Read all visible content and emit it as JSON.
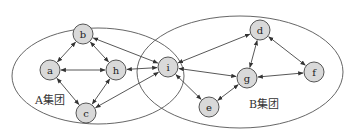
{
  "title": "",
  "colors": {
    "node_fill": "#d9d9d9",
    "node_stroke": "#555555",
    "edge": "#444444",
    "ellipse": "#555555",
    "text": "#333333"
  },
  "groups": [
    {
      "id": "A",
      "label": "A集团",
      "cx": 98,
      "cy": 76,
      "rx": 86,
      "ry": 48,
      "label_x": 35,
      "label_y": 104
    },
    {
      "id": "B",
      "label": "B集团",
      "cx": 240,
      "cy": 72,
      "rx": 103,
      "ry": 56,
      "label_x": 249,
      "label_y": 108
    }
  ],
  "nodes": [
    {
      "id": "a",
      "label": "a",
      "x": 50,
      "y": 70,
      "group": "A"
    },
    {
      "id": "b",
      "label": "b",
      "x": 83,
      "y": 34,
      "group": "A"
    },
    {
      "id": "h",
      "label": "h",
      "x": 116,
      "y": 70,
      "group": "A"
    },
    {
      "id": "c",
      "label": "c",
      "x": 86,
      "y": 113,
      "group": "A"
    },
    {
      "id": "i",
      "label": "i",
      "x": 168,
      "y": 67,
      "group": "A∩B"
    },
    {
      "id": "d",
      "label": "d",
      "x": 260,
      "y": 30,
      "group": "B"
    },
    {
      "id": "g",
      "label": "g",
      "x": 247,
      "y": 78,
      "group": "B"
    },
    {
      "id": "f",
      "label": "f",
      "x": 314,
      "y": 72,
      "group": "B"
    },
    {
      "id": "e",
      "label": "e",
      "x": 209,
      "y": 107,
      "group": "B"
    }
  ],
  "node_radius": 10,
  "edges": [
    {
      "from": "a",
      "to": "b",
      "bidirectional": true
    },
    {
      "from": "a",
      "to": "h",
      "bidirectional": true
    },
    {
      "from": "a",
      "to": "c",
      "bidirectional": true
    },
    {
      "from": "b",
      "to": "h",
      "bidirectional": true
    },
    {
      "from": "c",
      "to": "h",
      "bidirectional": true
    },
    {
      "from": "b",
      "to": "i",
      "bidirectional": true
    },
    {
      "from": "h",
      "to": "i",
      "bidirectional": true
    },
    {
      "from": "c",
      "to": "i",
      "bidirectional": true
    },
    {
      "from": "i",
      "to": "d",
      "bidirectional": true
    },
    {
      "from": "i",
      "to": "g",
      "bidirectional": true
    },
    {
      "from": "i",
      "to": "e",
      "bidirectional": true
    },
    {
      "from": "d",
      "to": "g",
      "bidirectional": true
    },
    {
      "from": "d",
      "to": "f",
      "bidirectional": true
    },
    {
      "from": "g",
      "to": "f",
      "bidirectional": true
    },
    {
      "from": "e",
      "to": "g",
      "bidirectional": true
    }
  ]
}
